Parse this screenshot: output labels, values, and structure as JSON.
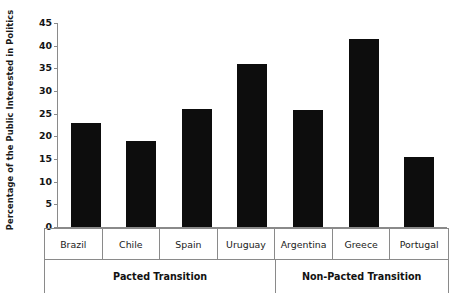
{
  "chart_data": {
    "type": "bar",
    "title": "",
    "xlabel": "",
    "ylabel": "Percentage of the Public Interested in Politics",
    "ylim": [
      0,
      45
    ],
    "ytick_step": 5,
    "yticks": [
      "0",
      "5",
      "10",
      "15",
      "20",
      "25",
      "30",
      "35",
      "40",
      "45"
    ],
    "grid": false,
    "legend": "none",
    "bar_color": "#0d0d0d",
    "axis_color": "#8a8a8a",
    "categories": [
      "Brazil",
      "Chile",
      "Spain",
      "Uruguay",
      "Argentina",
      "Greece",
      "Portugal"
    ],
    "values": [
      23,
      19,
      26,
      36,
      25.8,
      41.5,
      15.4
    ],
    "groups": [
      {
        "label": "Pacted Transition",
        "categories": [
          "Brazil",
          "Chile",
          "Spain",
          "Uruguay"
        ]
      },
      {
        "label": "Non-Pacted Transition",
        "categories": [
          "Argentina",
          "Greece",
          "Portugal"
        ]
      }
    ]
  },
  "axis": {
    "y_title": "Percentage of the Public Interested in Politics"
  },
  "labels": {
    "countries": [
      "Brazil",
      "Chile",
      "Spain",
      "Uruguay",
      "Argentina",
      "Greece",
      "Portugal"
    ],
    "group_left": "Pacted Transition",
    "group_right": "Non-Pacted Transition"
  }
}
